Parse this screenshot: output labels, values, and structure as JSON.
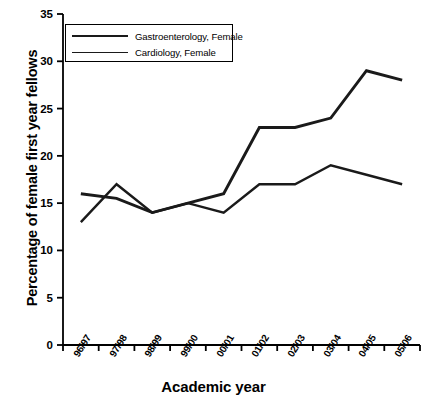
{
  "chart_data": {
    "type": "line",
    "title": "",
    "xlabel": "Academic year",
    "ylabel": "Percentage of female first year fellows",
    "categories": [
      "96/97",
      "97/98",
      "98/99",
      "99/00",
      "00/01",
      "01/02",
      "02/03",
      "03/04",
      "04/05",
      "05/06"
    ],
    "ylim": [
      0,
      35
    ],
    "yticks": [
      0,
      5,
      10,
      15,
      20,
      25,
      30,
      35
    ],
    "grid": false,
    "legend_position": "top-left",
    "series": [
      {
        "name": "Gastroenterology, Female",
        "color": "#1a1a1a",
        "values": [
          16,
          15.5,
          14,
          15,
          16,
          23,
          23,
          24,
          29,
          28
        ]
      },
      {
        "name": "Cardiology, Female",
        "color": "#1a1a1a",
        "values": [
          13,
          17,
          14,
          15,
          14,
          17,
          17,
          19,
          18,
          17
        ]
      }
    ]
  },
  "axis": {
    "ytick_labels": [
      "0",
      "5",
      "10",
      "15",
      "20",
      "25",
      "30",
      "35"
    ],
    "xtick_labels": [
      "96/97",
      "97/98",
      "98/99",
      "99/00",
      "00/01",
      "01/02",
      "02/03",
      "03/04",
      "04/05",
      "05/06"
    ],
    "y_title": "Percentage of female first year fellows",
    "x_title": "Academic year"
  },
  "legend": {
    "items": [
      {
        "label": "Gastroenterology, Female"
      },
      {
        "label": "Cardiology, Female"
      }
    ]
  }
}
